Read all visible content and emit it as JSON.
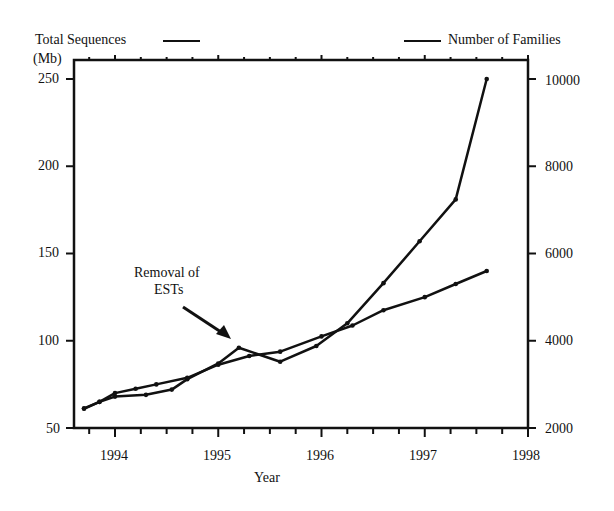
{
  "legend": {
    "left_label": "Total Sequences",
    "right_label": "Number of Families"
  },
  "axes": {
    "left_unit": "(Mb)",
    "left_ticks": [
      "250",
      "200",
      "150",
      "100",
      "50"
    ],
    "right_ticks": [
      "10000",
      "8000",
      "6000",
      "4000",
      "2000"
    ],
    "x_ticks": [
      "1994",
      "1995",
      "1996",
      "1997",
      "1998"
    ],
    "xlabel": "Year"
  },
  "annotation": {
    "line1": "Removal of",
    "line2": "ESTs"
  },
  "chart_data": {
    "type": "line",
    "title": "",
    "xlabel": "Year",
    "ylabel": "Total Sequences (Mb)",
    "ylabel_right": "Number of Families",
    "xlim": [
      1993.6,
      1998
    ],
    "ylim": [
      50,
      260
    ],
    "ylim_right": [
      2000,
      10400
    ],
    "grid": false,
    "legend_position": "top",
    "annotations": [
      {
        "text": "Removal of ESTs",
        "x": 1995.2,
        "y": 96
      }
    ],
    "series": [
      {
        "name": "Total Sequences",
        "axis": "left",
        "x": [
          1993.7,
          1993.85,
          1994.0,
          1994.3,
          1994.55,
          1994.7,
          1995.0,
          1995.2,
          1995.6,
          1995.95,
          1996.25,
          1996.6,
          1996.95,
          1997.3,
          1997.6
        ],
        "values": [
          61,
          65,
          68,
          69,
          72,
          78,
          87,
          96,
          88,
          97,
          110,
          133,
          157,
          181,
          250
        ]
      },
      {
        "name": "Number of Families",
        "axis": "right",
        "x": [
          1993.7,
          1993.85,
          1994.0,
          1994.2,
          1994.4,
          1994.7,
          1995.0,
          1995.3,
          1995.6,
          1996.0,
          1996.3,
          1996.6,
          1997.0,
          1997.3,
          1997.6
        ],
        "values": [
          2450,
          2600,
          2800,
          2900,
          3000,
          3150,
          3450,
          3650,
          3750,
          4100,
          4350,
          4700,
          5000,
          5300,
          5600
        ]
      }
    ]
  }
}
